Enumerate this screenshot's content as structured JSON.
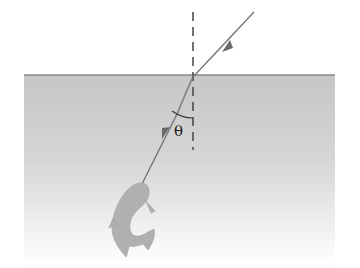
{
  "diagram": {
    "angle_label": "θ",
    "colors": {
      "water_top": "#c4c4c4",
      "water_bottom": "#ffffff",
      "surface_line": "#8a8a8a",
      "ray": "#7a7a7a",
      "normal": "#444444",
      "fish": "#b3b3b3"
    },
    "elements": [
      "incident-ray",
      "refracted-ray",
      "normal-line",
      "water-surface",
      "fish",
      "angle-arc"
    ]
  }
}
